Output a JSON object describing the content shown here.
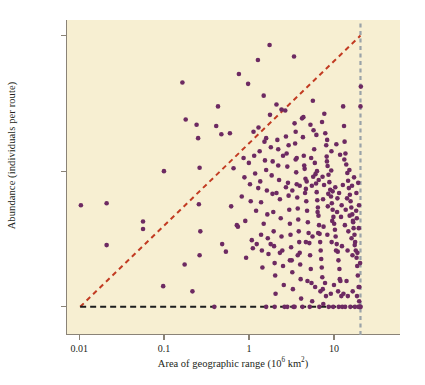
{
  "chart_data": {
    "type": "scatter",
    "title": "",
    "xlabel": "Area of geographic range (10⁶ km²)",
    "xlabel_text": "Area of geographic range (10",
    "xlabel_sup": "6",
    "xlabel_tail": " km",
    "xlabel_sup2": "2",
    "xlabel_close": ")",
    "ylabel": "Abundance (individuals per route)",
    "xscale": "log",
    "yscale": "log",
    "xlim": [
      0.007,
      60
    ],
    "ylim": [
      0.62,
      130
    ],
    "xticks": [
      0.01,
      0.1,
      1,
      10
    ],
    "xtick_labels": [
      "0.01",
      "0.1",
      "1",
      "10"
    ],
    "yticks": [
      1,
      10,
      100
    ],
    "ytick_labels": [
      "1",
      "10",
      "100"
    ],
    "grid": false,
    "legend": "none",
    "plot_background": "#f7efd2",
    "point_color": "#6d2a62",
    "point_size_px": 4.6,
    "annotations": [
      {
        "name": "upper-bound-line",
        "type": "dashed-line",
        "color": "#c23b22",
        "from": [
          0.01,
          1
        ],
        "to": [
          20,
          100
        ],
        "description": "red-orange dashed diagonal upper boundary (constraint envelope)"
      },
      {
        "name": "minimum-abundance-line",
        "type": "dashed-line",
        "color": "#1c1c1c",
        "from": [
          0.01,
          1
        ],
        "to": [
          20,
          1
        ],
        "description": "black dashed horizontal line at abundance = 1"
      },
      {
        "name": "maximum-range-line",
        "type": "dashed-line",
        "color": "#9aa3a8",
        "from": [
          20,
          0.62
        ],
        "to": [
          20,
          130
        ],
        "description": "gray-blue dashed vertical line at maximum geographic range"
      }
    ],
    "points": [
      [
        0.0102,
        5.6
      ],
      [
        0.0205,
        5.8
      ],
      [
        0.0205,
        2.85
      ],
      [
        0.055,
        4.25
      ],
      [
        0.055,
        3.75
      ],
      [
        0.097,
        10.0
      ],
      [
        0.095,
        1.42
      ],
      [
        0.16,
        45.0
      ],
      [
        0.175,
        24.0
      ],
      [
        0.17,
        2.05
      ],
      [
        0.21,
        1.3
      ],
      [
        0.235,
        22.0
      ],
      [
        0.245,
        17.5
      ],
      [
        0.255,
        10.6
      ],
      [
        0.25,
        5.7
      ],
      [
        0.26,
        3.6
      ],
      [
        0.255,
        2.4
      ],
      [
        0.38,
        1.0
      ],
      [
        0.4,
        21.5
      ],
      [
        0.42,
        30.0
      ],
      [
        0.46,
        18.7
      ],
      [
        0.47,
        2.9
      ],
      [
        0.52,
        2.55
      ],
      [
        0.58,
        19.0
      ],
      [
        0.6,
        5.5
      ],
      [
        0.64,
        10.5
      ],
      [
        0.7,
        4.0
      ],
      [
        0.72,
        3.9
      ],
      [
        0.74,
        52.0
      ],
      [
        0.8,
        6.5
      ],
      [
        0.84,
        12.5
      ],
      [
        0.86,
        9.0
      ],
      [
        0.88,
        4.3
      ],
      [
        0.9,
        2.3
      ],
      [
        0.95,
        44.0
      ],
      [
        0.97,
        11.5
      ],
      [
        1.0,
        8.0
      ],
      [
        1.02,
        6.0
      ],
      [
        1.05,
        3.1
      ],
      [
        1.08,
        2.7
      ],
      [
        1.1,
        19.5
      ],
      [
        1.12,
        13.0
      ],
      [
        1.15,
        9.6
      ],
      [
        1.18,
        5.1
      ],
      [
        1.2,
        2.9
      ],
      [
        1.24,
        66.0
      ],
      [
        1.26,
        21.0
      ],
      [
        1.3,
        14.0
      ],
      [
        1.32,
        8.4
      ],
      [
        1.35,
        3.4
      ],
      [
        1.38,
        2.6
      ],
      [
        1.4,
        1.95
      ],
      [
        1.45,
        36.0
      ],
      [
        1.48,
        16.5
      ],
      [
        1.5,
        12.0
      ],
      [
        1.55,
        10.2
      ],
      [
        1.58,
        7.2
      ],
      [
        1.6,
        4.8
      ],
      [
        1.62,
        3.2
      ],
      [
        1.65,
        2.45
      ],
      [
        1.7,
        85.0
      ],
      [
        1.72,
        26.0
      ],
      [
        1.76,
        15.0
      ],
      [
        1.8,
        9.3
      ],
      [
        1.84,
        6.8
      ],
      [
        1.88,
        5.0
      ],
      [
        1.9,
        3.6
      ],
      [
        1.92,
        2.8
      ],
      [
        1.95,
        2.1
      ],
      [
        1.98,
        1.7
      ],
      [
        2.0,
        1.25
      ],
      [
        2.05,
        31.0
      ],
      [
        2.1,
        17.0
      ],
      [
        2.15,
        11.0
      ],
      [
        2.2,
        8.6
      ],
      [
        2.25,
        6.2
      ],
      [
        2.3,
        4.5
      ],
      [
        2.35,
        3.3
      ],
      [
        2.4,
        2.6
      ],
      [
        2.45,
        2.0
      ],
      [
        2.5,
        1.45
      ],
      [
        2.55,
        1.0
      ],
      [
        2.6,
        28.0
      ],
      [
        2.65,
        18.0
      ],
      [
        2.7,
        13.5
      ],
      [
        2.75,
        10.8
      ],
      [
        2.8,
        8.2
      ],
      [
        2.85,
        6.6
      ],
      [
        2.9,
        5.2
      ],
      [
        2.95,
        4.1
      ],
      [
        3.0,
        3.4
      ],
      [
        3.05,
        2.75
      ],
      [
        3.1,
        2.2
      ],
      [
        3.15,
        1.8
      ],
      [
        3.2,
        1.35
      ],
      [
        3.25,
        1.0
      ],
      [
        3.3,
        70.0
      ],
      [
        3.35,
        22.5
      ],
      [
        3.4,
        16.0
      ],
      [
        3.45,
        12.2
      ],
      [
        3.5,
        9.8
      ],
      [
        3.55,
        8.0
      ],
      [
        3.6,
        6.4
      ],
      [
        3.65,
        5.3
      ],
      [
        3.7,
        4.4
      ],
      [
        3.75,
        3.6
      ],
      [
        3.8,
        3.0
      ],
      [
        3.85,
        2.5
      ],
      [
        3.9,
        2.05
      ],
      [
        3.95,
        1.6
      ],
      [
        4.0,
        1.15
      ],
      [
        4.1,
        24.5
      ],
      [
        4.2,
        17.8
      ],
      [
        4.3,
        13.0
      ],
      [
        4.4,
        10.4
      ],
      [
        4.5,
        8.8
      ],
      [
        4.55,
        7.4
      ],
      [
        4.6,
        6.0
      ],
      [
        4.7,
        5.1
      ],
      [
        4.8,
        4.2
      ],
      [
        4.9,
        3.5
      ],
      [
        5.0,
        2.95
      ],
      [
        5.1,
        2.4
      ],
      [
        5.2,
        1.9
      ],
      [
        5.3,
        1.5
      ],
      [
        5.4,
        1.1
      ],
      [
        5.5,
        33.0
      ],
      [
        5.6,
        20.0
      ],
      [
        5.7,
        14.5
      ],
      [
        5.8,
        11.5
      ],
      [
        5.9,
        9.5
      ],
      [
        6.0,
        8.1
      ],
      [
        6.1,
        7.0
      ],
      [
        6.2,
        6.1
      ],
      [
        6.3,
        5.4
      ],
      [
        6.4,
        4.7
      ],
      [
        6.5,
        4.0
      ],
      [
        6.6,
        3.45
      ],
      [
        6.7,
        3.0
      ],
      [
        6.8,
        2.6
      ],
      [
        6.9,
        2.25
      ],
      [
        7.0,
        1.95
      ],
      [
        7.1,
        1.65
      ],
      [
        7.2,
        1.35
      ],
      [
        7.3,
        1.05
      ],
      [
        7.5,
        26.5
      ],
      [
        7.7,
        19.0
      ],
      [
        7.9,
        15.5
      ],
      [
        8.0,
        12.8
      ],
      [
        8.2,
        10.9
      ],
      [
        8.4,
        9.4
      ],
      [
        8.6,
        8.3
      ],
      [
        8.8,
        7.3
      ],
      [
        9.0,
        6.5
      ],
      [
        9.2,
        5.8
      ],
      [
        9.4,
        5.2
      ],
      [
        9.6,
        4.6
      ],
      [
        9.8,
        4.1
      ],
      [
        10.0,
        3.7
      ],
      [
        10.2,
        3.3
      ],
      [
        10.5,
        2.9
      ],
      [
        10.8,
        2.55
      ],
      [
        11.0,
        2.2
      ],
      [
        11.3,
        1.9
      ],
      [
        11.6,
        1.55
      ],
      [
        11.9,
        1.2
      ],
      [
        12.2,
        1.0
      ],
      [
        12.5,
        30.0
      ],
      [
        12.8,
        21.5
      ],
      [
        13.0,
        16.5
      ],
      [
        13.3,
        13.5
      ],
      [
        13.6,
        11.2
      ],
      [
        14.0,
        9.7
      ],
      [
        14.3,
        8.5
      ],
      [
        14.6,
        7.5
      ],
      [
        15.0,
        6.7
      ],
      [
        15.3,
        6.0
      ],
      [
        15.6,
        5.4
      ],
      [
        16.0,
        4.8
      ],
      [
        16.3,
        4.3
      ],
      [
        16.6,
        3.8
      ],
      [
        17.0,
        3.4
      ],
      [
        17.3,
        3.0
      ],
      [
        17.6,
        2.6
      ],
      [
        18.0,
        2.3
      ],
      [
        18.3,
        2.0
      ],
      [
        18.6,
        1.7
      ],
      [
        19.0,
        1.4
      ],
      [
        19.3,
        1.1
      ],
      [
        19.6,
        1.0
      ],
      [
        20.0,
        30.0
      ],
      [
        20.2,
        42.0
      ],
      [
        19.8,
        2.1
      ],
      [
        19.5,
        1.0
      ],
      [
        20.1,
        1.0
      ],
      [
        2.35,
        28.5
      ],
      [
        3.45,
        19.5
      ],
      [
        4.25,
        25.0
      ],
      [
        5.15,
        22.0
      ],
      [
        6.05,
        18.5
      ],
      [
        7.05,
        23.0
      ],
      [
        8.1,
        17.0
      ],
      [
        9.1,
        14.0
      ],
      [
        10.4,
        15.8
      ],
      [
        11.5,
        13.2
      ],
      [
        12.9,
        12.2
      ],
      [
        14.8,
        10.2
      ],
      [
        16.8,
        9.0
      ],
      [
        18.8,
        8.2
      ],
      [
        17.9,
        6.9
      ],
      [
        15.9,
        7.8
      ],
      [
        13.9,
        6.3
      ],
      [
        12.4,
        7.9
      ],
      [
        11.2,
        6.9
      ],
      [
        10.1,
        7.6
      ],
      [
        9.05,
        10.1
      ],
      [
        8.05,
        11.8
      ],
      [
        7.15,
        9.1
      ],
      [
        6.15,
        10.0
      ],
      [
        5.25,
        12.5
      ],
      [
        4.35,
        11.0
      ],
      [
        3.55,
        12.5
      ],
      [
        2.85,
        15.5
      ],
      [
        2.45,
        13.0
      ],
      [
        2.15,
        14.5
      ],
      [
        1.85,
        11.8
      ],
      [
        1.55,
        17.5
      ],
      [
        4.45,
        6.9
      ],
      [
        5.35,
        7.8
      ],
      [
        6.25,
        5.0
      ],
      [
        7.25,
        6.2
      ],
      [
        8.25,
        5.5
      ],
      [
        9.3,
        4.3
      ],
      [
        10.6,
        5.0
      ],
      [
        11.8,
        4.6
      ],
      [
        13.1,
        4.0
      ],
      [
        14.4,
        3.6
      ],
      [
        15.7,
        3.2
      ],
      [
        17.1,
        2.85
      ],
      [
        18.4,
        2.5
      ],
      [
        19.1,
        3.8
      ],
      [
        18.1,
        4.5
      ],
      [
        16.1,
        2.4
      ],
      [
        14.1,
        2.6
      ],
      [
        12.1,
        2.8
      ],
      [
        10.3,
        2.6
      ],
      [
        9.15,
        3.0
      ],
      [
        8.15,
        3.4
      ],
      [
        7.35,
        3.9
      ],
      [
        6.35,
        3.5
      ],
      [
        5.45,
        3.3
      ],
      [
        4.55,
        3.0
      ],
      [
        3.65,
        2.4
      ],
      [
        2.95,
        2.2
      ],
      [
        2.25,
        2.5
      ],
      [
        1.75,
        2.9
      ],
      [
        1.45,
        4.1
      ],
      [
        1.35,
        5.9
      ],
      [
        1.25,
        7.5
      ],
      [
        2.05,
        6.9
      ],
      [
        2.65,
        7.6
      ],
      [
        3.15,
        7.2
      ],
      [
        3.85,
        7.8
      ],
      [
        4.65,
        8.4
      ],
      [
        5.55,
        9.1
      ],
      [
        6.45,
        8.6
      ],
      [
        7.45,
        7.9
      ],
      [
        8.35,
        6.8
      ],
      [
        9.4,
        7.1
      ],
      [
        10.7,
        6.3
      ],
      [
        12.0,
        5.6
      ],
      [
        13.4,
        5.2
      ],
      [
        14.9,
        4.7
      ],
      [
        16.4,
        4.2
      ],
      [
        17.8,
        5.1
      ],
      [
        19.2,
        5.6
      ],
      [
        5.05,
        1.0
      ],
      [
        6.55,
        1.0
      ],
      [
        8.45,
        1.0
      ],
      [
        9.55,
        1.0
      ],
      [
        11.1,
        1.0
      ],
      [
        13.2,
        1.0
      ],
      [
        15.2,
        1.0
      ],
      [
        17.2,
        1.0
      ],
      [
        18.9,
        1.0
      ],
      [
        4.15,
        1.0
      ],
      [
        3.35,
        1.0
      ],
      [
        2.75,
        1.0
      ],
      [
        1.95,
        1.0
      ],
      [
        1.55,
        1.0
      ],
      [
        6.75,
        1.3
      ],
      [
        7.85,
        1.2
      ],
      [
        8.95,
        1.25
      ],
      [
        10.9,
        1.3
      ],
      [
        12.6,
        1.25
      ],
      [
        14.2,
        1.2
      ],
      [
        16.2,
        1.3
      ],
      [
        18.2,
        1.2
      ],
      [
        19.4,
        1.4
      ],
      [
        13.7,
        1.55
      ],
      [
        11.4,
        1.6
      ],
      [
        9.75,
        1.45
      ],
      [
        7.65,
        1.5
      ],
      [
        5.85,
        1.4
      ],
      [
        4.75,
        1.55
      ]
    ]
  }
}
